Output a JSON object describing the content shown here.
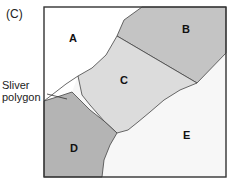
{
  "panel_label": "(C)",
  "callout": {
    "line1": "Sliver",
    "line2": "polygon"
  },
  "regions": {
    "A": {
      "label": "A",
      "fill": "#ffffff"
    },
    "B": {
      "label": "B",
      "fill": "#c4c4c4"
    },
    "C": {
      "label": "C",
      "fill": "#dcdcdc"
    },
    "D": {
      "label": "D",
      "fill": "#b4b4b4"
    },
    "E": {
      "label": "E",
      "fill": "#f7f7f7"
    }
  },
  "colors": {
    "frame": "#333333",
    "boundary": "#444444"
  }
}
